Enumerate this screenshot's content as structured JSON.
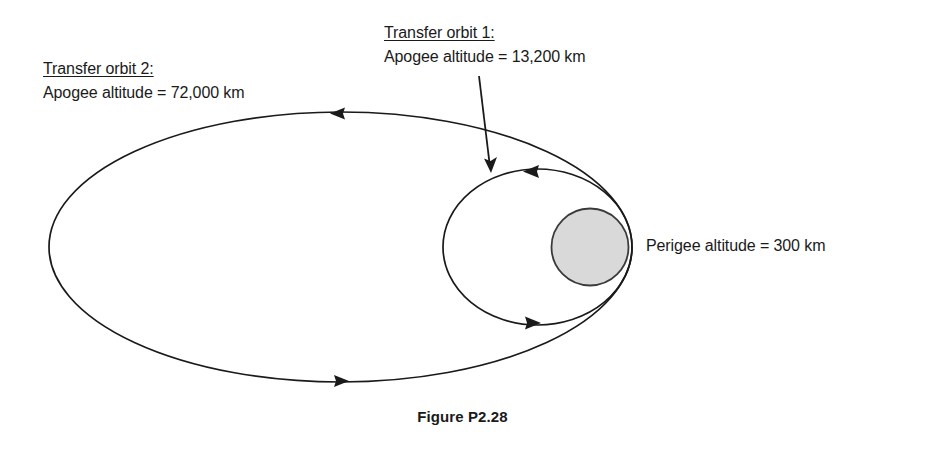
{
  "figure": {
    "caption": "Figure P2.28",
    "background_color": "#ffffff",
    "stroke_color": "#1a1a1a",
    "earth_fill_color": "#d9d9d9"
  },
  "labels": {
    "transfer_orbit_2": {
      "title": "Transfer orbit 2:",
      "detail": "Apogee altitude = 72,000 km"
    },
    "transfer_orbit_1": {
      "title": "Transfer orbit 1:",
      "detail": "Apogee altitude = 13,200 km"
    },
    "perigee": {
      "text": "Perigee altitude = 300 km"
    }
  },
  "diagram": {
    "outer_orbit": {
      "name": "transfer orbit 2",
      "apogee_altitude_km": 72000,
      "center_x": 340.5,
      "center_y": 247,
      "semi_major_px": 291.5,
      "semi_minor_px": 135,
      "direction": "counterclockwise"
    },
    "inner_orbit": {
      "name": "transfer orbit 1",
      "apogee_altitude_km": 13200,
      "center_x": 537.5,
      "center_y": 247,
      "semi_major_px": 94.5,
      "semi_minor_px": 78,
      "direction": "counterclockwise"
    },
    "earth": {
      "name": "earth",
      "center_x": 590,
      "center_y": 247,
      "radius_px": 38.5
    },
    "perigee_point": {
      "x": 632,
      "y": 246,
      "altitude_km": 300
    },
    "arrow_markers": [
      {
        "name": "outer-orbit-top-arrow",
        "x": 338,
        "y": 113,
        "points": "left"
      },
      {
        "name": "outer-orbit-bottom-arrow",
        "x": 340,
        "y": 381,
        "points": "right"
      },
      {
        "name": "inner-orbit-top-arrow",
        "x": 532,
        "y": 171,
        "points": "left"
      },
      {
        "name": "inner-orbit-bottom-arrow",
        "x": 532,
        "y": 323,
        "points": "right"
      }
    ],
    "leader_arrow": {
      "name": "transfer-orbit-1-leader",
      "from_x": 479,
      "from_y": 76,
      "to_x": 491,
      "to_y": 171
    }
  }
}
